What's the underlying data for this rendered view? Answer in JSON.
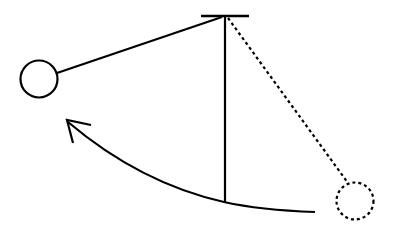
{
  "diagram": {
    "stroke_color": "#000000",
    "background": "#ffffff",
    "elements": [
      {
        "id": "pivot-bar",
        "type": "line"
      },
      {
        "id": "rest-string",
        "type": "line",
        "style": "solid"
      },
      {
        "id": "swung-string",
        "type": "line",
        "style": "solid"
      },
      {
        "id": "swung-bob",
        "type": "circle",
        "style": "solid"
      },
      {
        "id": "start-string",
        "type": "line",
        "style": "dashed"
      },
      {
        "id": "start-bob",
        "type": "circle",
        "style": "dashed"
      },
      {
        "id": "swing-arc",
        "type": "arc-arrow",
        "direction": "left"
      }
    ]
  }
}
